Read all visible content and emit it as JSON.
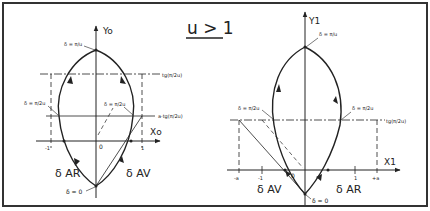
{
  "title": "u > 1",
  "left_diagram": {
    "y_axis_label": "Yo",
    "x_axis_label": "Xo",
    "origin_label": "0",
    "tick_minus_one": "-1",
    "tick_plus_one": "1",
    "top_point_label": "δ = π/u",
    "left_mid_label": "δ = π/2u",
    "right_mid_label": "δ = π/2u",
    "bottom_point_label": "δ = 0",
    "upper_line_label": "tg(π/2u)",
    "lower_line_label": "a·tg(π/2u)",
    "left_branch_label": "δ AR",
    "right_branch_label": "δ AV"
  },
  "right_diagram": {
    "y_axis_label": "Y1",
    "x_axis_label": "X1",
    "origin_label": "0",
    "tick_minus_a": "-a",
    "tick_minus_one": "-1",
    "tick_plus_one": "1",
    "tick_plus_a": "+a",
    "top_point_label": "δ = π/u",
    "left_mid_label": "δ = π/2u",
    "right_mid_label": "δ = π/2u",
    "bottom_point_label": "δ = 0",
    "line_label": "tg(π/2u)",
    "left_branch_label": "δ AV",
    "right_branch_label": "δ AR"
  },
  "colors": {
    "ink": "#222222",
    "background": "#ffffff",
    "frame": "#333333"
  }
}
